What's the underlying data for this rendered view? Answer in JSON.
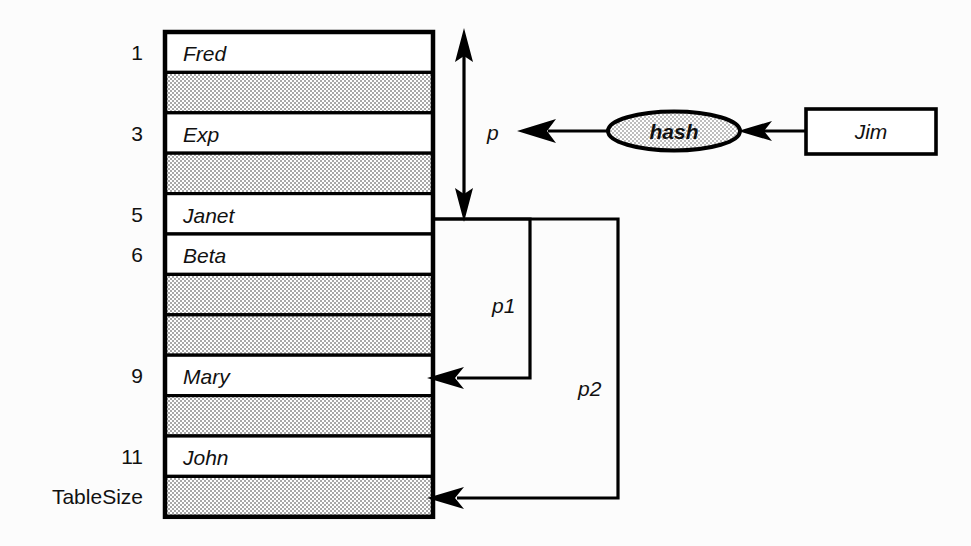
{
  "diagram": {
    "background_color": "#fcfcfc",
    "stroke_color": "#000000",
    "empty_slot_fill": "#c9c9c9",
    "filled_slot_fill": "#ffffff"
  },
  "table": {
    "name": "hash-table",
    "left": 165,
    "top": 32,
    "width": 268,
    "row_height": 40.4,
    "row_count": 12,
    "rows": [
      {
        "index_label": "1",
        "value": "Fred",
        "empty": false
      },
      {
        "index_label": "",
        "value": "",
        "empty": true
      },
      {
        "index_label": "3",
        "value": "Exp",
        "empty": false
      },
      {
        "index_label": "",
        "value": "",
        "empty": true
      },
      {
        "index_label": "5",
        "value": "Janet",
        "empty": false
      },
      {
        "index_label": "6",
        "value": "Beta",
        "empty": false
      },
      {
        "index_label": "",
        "value": "",
        "empty": true
      },
      {
        "index_label": "",
        "value": "",
        "empty": true
      },
      {
        "index_label": "9",
        "value": "Mary",
        "empty": false
      },
      {
        "index_label": "",
        "value": "",
        "empty": true
      },
      {
        "index_label": "11",
        "value": "John",
        "empty": false
      },
      {
        "index_label": "TableSize",
        "value": "",
        "empty": true
      }
    ]
  },
  "nodes": {
    "hash_ellipse": {
      "label": "hash",
      "cx": 674,
      "cy": 131,
      "rx": 66,
      "ry": 19,
      "fill": "#d9d9d9"
    },
    "jim_box": {
      "label": "Jim",
      "x": 806,
      "y": 109,
      "width": 130,
      "height": 45,
      "fill": "#ffffff"
    }
  },
  "pointers": {
    "p": {
      "label": "p",
      "x": 487,
      "y": 123
    },
    "p1": {
      "label": "p1",
      "x": 492,
      "y": 296
    },
    "p2": {
      "label": "p2",
      "x": 578,
      "y": 379
    }
  },
  "edges": [
    {
      "name": "jim-to-hash",
      "from": "jim_box",
      "to": "hash_ellipse",
      "kind": "arrow"
    },
    {
      "name": "hash-to-p",
      "from": "hash_ellipse",
      "to": "p",
      "kind": "arrow"
    },
    {
      "name": "p-range",
      "from": "table-top",
      "to": "slot-5",
      "kind": "double-arrow"
    },
    {
      "name": "p1-to-slot9",
      "from": "slot-5-edge",
      "to": "slot-9",
      "kind": "arrow"
    },
    {
      "name": "p2-to-slot12",
      "from": "slot-5-edge",
      "to": "slot-12",
      "kind": "arrow"
    }
  ]
}
